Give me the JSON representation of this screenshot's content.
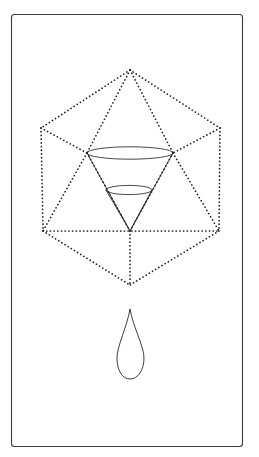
{
  "artwork": {
    "title": "Dotted Icosahedron Net with Funnel and Droplet",
    "medium": "line drawing",
    "background_color": "#ffffff",
    "ink_color": "#26262c",
    "dotted_ink_color": "#1d1d22",
    "frame_color": "#3a3a42",
    "canvas": {
      "width": 259,
      "height": 457
    }
  },
  "frame": {
    "name": "page-border",
    "x": 11,
    "y": 14,
    "width": 231,
    "height": 432,
    "corner_radius": 3,
    "stroke_width": 1.1
  },
  "polyhedron": {
    "name": "dotted-icosahedron-outline",
    "style": "dotted",
    "dot_spacing": 3.6,
    "dot_size": 1.7,
    "vertices": {
      "top_apex": {
        "x": 130,
        "y": 70
      },
      "upper_left": {
        "x": 41,
        "y": 128
      },
      "upper_right": {
        "x": 220,
        "y": 128
      },
      "mid_left": {
        "x": 87,
        "y": 153
      },
      "mid_right": {
        "x": 173,
        "y": 153
      },
      "lower_left": {
        "x": 43,
        "y": 231
      },
      "lower_right": {
        "x": 219,
        "y": 231
      },
      "bottom_apex": {
        "x": 130,
        "y": 285
      },
      "center": {
        "x": 130,
        "y": 231
      }
    },
    "edges": [
      {
        "name": "apex-to-upper-left",
        "from": "top_apex",
        "to": "upper_left"
      },
      {
        "name": "apex-to-upper-right",
        "from": "top_apex",
        "to": "upper_right"
      },
      {
        "name": "apex-to-mid-left",
        "from": "top_apex",
        "to": "mid_left"
      },
      {
        "name": "apex-to-mid-right",
        "from": "top_apex",
        "to": "mid_right"
      },
      {
        "name": "upper-left-to-mid-left",
        "from": "upper_left",
        "to": "mid_left"
      },
      {
        "name": "upper-right-to-mid-right",
        "from": "upper_right",
        "to": "mid_right"
      },
      {
        "name": "upper-left-to-lower-left",
        "from": "upper_left",
        "to": "lower_left"
      },
      {
        "name": "upper-right-to-lower-right",
        "from": "upper_right",
        "to": "lower_right"
      },
      {
        "name": "mid-left-to-center",
        "from": "mid_left",
        "to": "center"
      },
      {
        "name": "mid-right-to-center",
        "from": "mid_right",
        "to": "center"
      },
      {
        "name": "mid-left-to-lower-left",
        "from": "mid_left",
        "to": "lower_left"
      },
      {
        "name": "mid-right-to-lower-right",
        "from": "mid_right",
        "to": "lower_right"
      },
      {
        "name": "horizontal-equator",
        "from": "lower_left",
        "to": "lower_right"
      },
      {
        "name": "lower-left-to-bottom-apex",
        "from": "lower_left",
        "to": "bottom_apex"
      },
      {
        "name": "lower-right-to-bottom-apex",
        "from": "lower_right",
        "to": "bottom_apex"
      },
      {
        "name": "center-to-bottom-apex",
        "from": "center",
        "to": "bottom_apex"
      }
    ]
  },
  "funnel": {
    "name": "inverted-cone-funnel",
    "style": "solid",
    "outer_rim": {
      "cx": 130,
      "cy": 153,
      "rx": 43,
      "ry": 6.2
    },
    "inner_rim": {
      "cx": 129,
      "cy": 190,
      "rx": 23,
      "ry": 4.6
    },
    "apex": {
      "x": 130,
      "y": 231
    },
    "outer_wall_left": {
      "x": 87,
      "y": 153
    },
    "outer_wall_right": {
      "x": 173,
      "y": 153
    },
    "inner_wall_left": {
      "x": 106,
      "y": 190
    },
    "inner_wall_right": {
      "x": 152,
      "y": 190
    }
  },
  "droplet": {
    "name": "teardrop",
    "style": "solid",
    "tip": {
      "x": 130,
      "y": 309
    },
    "bottom": {
      "x": 130,
      "y": 379
    },
    "widest_y": 358,
    "left_extreme_x": 117,
    "right_extreme_x": 144
  }
}
